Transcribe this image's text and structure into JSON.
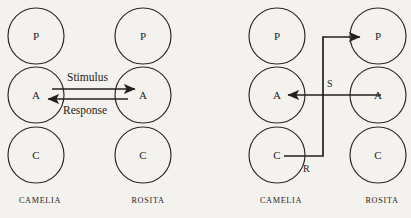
{
  "figure": {
    "background_color": "#f4f2ee",
    "ink_color": "#231f1d",
    "panels": [
      {
        "id": "complementary-transaction",
        "people": [
          {
            "id": "camelia-left",
            "name": "CAMELIA",
            "states": [
              {
                "code": "P",
                "name": "Parent"
              },
              {
                "code": "A",
                "name": "Adult"
              },
              {
                "code": "C",
                "name": "Child"
              }
            ]
          },
          {
            "id": "rosita-left",
            "name": "ROSITA",
            "states": [
              {
                "code": "P",
                "name": "Parent"
              },
              {
                "code": "A",
                "name": "Adult"
              },
              {
                "code": "C",
                "name": "Child"
              }
            ]
          }
        ],
        "vectors": [
          {
            "id": "stimulus",
            "label": "Stimulus",
            "from": "camelia-A",
            "to": "rosita-A",
            "direction": "right"
          },
          {
            "id": "response",
            "label": "Response",
            "from": "rosita-A",
            "to": "camelia-A",
            "direction": "left"
          }
        ]
      },
      {
        "id": "crossed-transaction",
        "people": [
          {
            "id": "camelia-right",
            "name": "CAMELIA",
            "states": [
              {
                "code": "P",
                "name": "Parent"
              },
              {
                "code": "A",
                "name": "Adult"
              },
              {
                "code": "C",
                "name": "Child"
              }
            ]
          },
          {
            "id": "rosita-right",
            "name": "ROSITA",
            "states": [
              {
                "code": "P",
                "name": "Parent"
              },
              {
                "code": "A",
                "name": "Adult"
              },
              {
                "code": "C",
                "name": "Child"
              }
            ]
          }
        ],
        "vectors": [
          {
            "id": "stimulus-s",
            "label": "S",
            "from": "rosita-A",
            "to": "camelia-A",
            "direction": "left"
          },
          {
            "id": "response-r",
            "label": "R",
            "from": "camelia-C",
            "to": "rosita-P",
            "direction": "up-right"
          }
        ]
      }
    ]
  }
}
